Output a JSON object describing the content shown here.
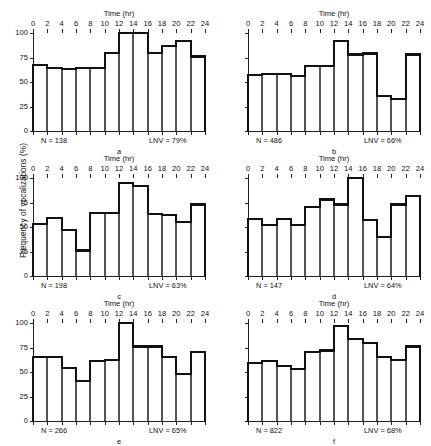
{
  "figure": {
    "y_axis_title": "Frequency of vocalizations (%)",
    "time_axis_title": "Time (hr)"
  },
  "chart_data": [
    {
      "type": "bar",
      "panel": "a",
      "title": "",
      "xlabel": "Time (hr)",
      "ylabel": "Frequency of vocalizations (%)",
      "xlim": [
        0,
        24
      ],
      "ylim": [
        0,
        100
      ],
      "yticks": [
        0,
        25,
        50,
        75,
        100
      ],
      "xticks": [
        0,
        2,
        4,
        6,
        8,
        10,
        12,
        14,
        16,
        18,
        20,
        22,
        24
      ],
      "categories": [
        "0-2",
        "2-4",
        "4-6",
        "6-8",
        "8-10",
        "10-12",
        "12-14",
        "14-16",
        "16-18",
        "18-20",
        "20-22",
        "22-24"
      ],
      "values": [
        67,
        64,
        63,
        64,
        64,
        80,
        100,
        100,
        80,
        87,
        92,
        76
      ],
      "values_tail": 74,
      "n_label": "N = 138",
      "lnv_label": "LNV = 79%",
      "n": 138,
      "lnv": 79,
      "grid": false,
      "legend": "none"
    },
    {
      "type": "bar",
      "panel": "b",
      "title": "",
      "xlabel": "Time (hr)",
      "ylabel": "Frequency of vocalizations (%)",
      "xlim": [
        0,
        24
      ],
      "ylim": [
        0,
        100
      ],
      "yticks": [
        0,
        25,
        50,
        75,
        100
      ],
      "xticks": [
        0,
        2,
        4,
        6,
        8,
        10,
        12,
        14,
        16,
        18,
        20,
        22,
        24
      ],
      "categories": [
        "0-2",
        "2-4",
        "4-6",
        "6-8",
        "8-10",
        "10-12",
        "12-14",
        "14-16",
        "16-18",
        "18-20",
        "20-22",
        "22-24"
      ],
      "values": [
        57,
        58,
        58,
        56,
        66,
        66,
        92,
        78,
        79,
        36,
        33,
        78
      ],
      "values_tail": 74,
      "n_label": "N = 486",
      "lnv_label": "LNV = 66%",
      "n": 486,
      "lnv": 66,
      "grid": false,
      "legend": "none"
    },
    {
      "type": "bar",
      "panel": "c",
      "title": "",
      "xlabel": "Time (hr)",
      "ylabel": "Frequency of vocalizations (%)",
      "xlim": [
        0,
        24
      ],
      "ylim": [
        0,
        100
      ],
      "yticks": [
        0,
        25,
        50,
        75,
        100
      ],
      "xticks": [
        0,
        2,
        4,
        6,
        8,
        10,
        12,
        14,
        16,
        18,
        20,
        22,
        24
      ],
      "categories": [
        "0-2",
        "2-4",
        "4-6",
        "6-8",
        "8-10",
        "10-12",
        "12-14",
        "14-16",
        "16-18",
        "18-20",
        "20-22",
        "22-24"
      ],
      "values": [
        53,
        59,
        47,
        26,
        64,
        64,
        95,
        92,
        63,
        62,
        55,
        73
      ],
      "values_tail": 72,
      "n_label": "N = 198",
      "lnv_label": "LNV = 63%",
      "n": 198,
      "lnv": 63,
      "grid": false,
      "legend": "none"
    },
    {
      "type": "bar",
      "panel": "d",
      "title": "",
      "xlabel": "Time (hr)",
      "ylabel": "Frequency of vocalizations (%)",
      "xlim": [
        0,
        24
      ],
      "ylim": [
        0,
        100
      ],
      "yticks": [
        0,
        25,
        50,
        75,
        100
      ],
      "xticks": [
        0,
        2,
        4,
        6,
        8,
        10,
        12,
        14,
        16,
        18,
        20,
        22,
        24
      ],
      "categories": [
        "0-2",
        "2-4",
        "4-6",
        "6-8",
        "8-10",
        "10-12",
        "12-14",
        "14-16",
        "16-18",
        "18-20",
        "20-22",
        "22-24"
      ],
      "values": [
        58,
        52,
        58,
        52,
        70,
        78,
        73,
        100,
        57,
        40,
        73,
        82
      ],
      "values_tail": 85,
      "n_label": "N = 147",
      "lnv_label": "LNV = 64%",
      "n": 147,
      "lnv": 64,
      "grid": false,
      "legend": "none"
    },
    {
      "type": "bar",
      "panel": "e",
      "title": "",
      "xlabel": "Time (hr)",
      "ylabel": "Frequency of vocalizations (%)",
      "xlim": [
        0,
        24
      ],
      "ylim": [
        0,
        100
      ],
      "yticks": [
        0,
        25,
        50,
        75,
        100
      ],
      "xticks": [
        0,
        2,
        4,
        6,
        8,
        10,
        12,
        14,
        16,
        18,
        20,
        22,
        24
      ],
      "categories": [
        "0-2",
        "2-4",
        "4-6",
        "6-8",
        "8-10",
        "10-12",
        "12-14",
        "14-16",
        "16-18",
        "18-20",
        "20-22",
        "22-24"
      ],
      "values": [
        65,
        65,
        54,
        41,
        61,
        62,
        100,
        76,
        76,
        65,
        48,
        70
      ],
      "values_tail": 74,
      "n_label": "N = 266",
      "lnv_label": "LNV = 65%",
      "n": 266,
      "lnv": 65,
      "grid": false,
      "legend": "none"
    },
    {
      "type": "bar",
      "panel": "f",
      "title": "",
      "xlabel": "Time (hr)",
      "ylabel": "Frequency of vocalizations (%)",
      "xlim": [
        0,
        24
      ],
      "ylim": [
        0,
        100
      ],
      "yticks": [
        0,
        25,
        50,
        75,
        100
      ],
      "xticks": [
        0,
        2,
        4,
        6,
        8,
        10,
        12,
        14,
        16,
        18,
        20,
        22,
        24
      ],
      "categories": [
        "0-2",
        "2-4",
        "4-6",
        "6-8",
        "8-10",
        "10-12",
        "12-14",
        "14-16",
        "16-18",
        "18-20",
        "20-22",
        "22-24"
      ],
      "values": [
        59,
        61,
        56,
        53,
        70,
        72,
        97,
        84,
        80,
        65,
        62,
        76
      ],
      "values_tail": 74,
      "n_label": "N = 822",
      "lnv_label": "LNV = 68%",
      "n": 822,
      "lnv": 68,
      "grid": false,
      "legend": "none"
    }
  ]
}
